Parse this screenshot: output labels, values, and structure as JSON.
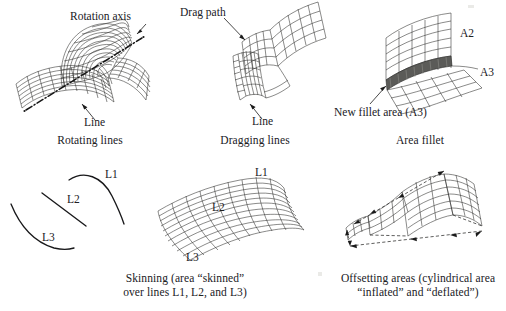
{
  "figure": {
    "background_color": "#ffffff",
    "ink_color": "#20201e",
    "panel_count": 6,
    "layout": "2 rows x 3 columns"
  },
  "panels": [
    {
      "id": "rotating-lines",
      "caption": "Rotating lines",
      "annotations": [
        {
          "name": "rotation-axis",
          "text": "Rotation axis"
        },
        {
          "name": "line",
          "text": "Line"
        }
      ]
    },
    {
      "id": "dragging-lines",
      "caption": "Dragging lines",
      "annotations": [
        {
          "name": "drag-path",
          "text": "Drag path"
        },
        {
          "name": "line",
          "text": "Line"
        }
      ]
    },
    {
      "id": "area-fillet",
      "caption": "Area fillet",
      "annotations": [
        {
          "name": "area-a2",
          "text": "A2"
        },
        {
          "name": "area-a3",
          "text": "A3"
        },
        {
          "name": "new-fillet-area",
          "text": "New fillet area (A3)"
        }
      ]
    },
    {
      "id": "skinning-lines",
      "caption": "Skinning (area “skinned”\nover lines L1, L2, and L3)",
      "annotations": [
        {
          "name": "curve-l1",
          "text": "L1"
        },
        {
          "name": "curve-l2",
          "text": "L2"
        },
        {
          "name": "curve-l3",
          "text": "L3"
        }
      ]
    },
    {
      "id": "skinning-surface",
      "caption": "",
      "annotations": [
        {
          "name": "curve-l1",
          "text": "L1"
        },
        {
          "name": "curve-l2",
          "text": "L2"
        },
        {
          "name": "curve-l3",
          "text": "L3"
        }
      ]
    },
    {
      "id": "offsetting-areas",
      "caption": "Offsetting areas (cylindrical area\n“inflated” and “deflated”)",
      "annotations": []
    }
  ],
  "text": {
    "rotation_axis": "Rotation axis",
    "line_1": "Line",
    "line_2": "Line",
    "drag_path": "Drag path",
    "a2": "A2",
    "a3": "A3",
    "new_fillet_area": "New fillet area (A3)",
    "cap_rotating": "Rotating lines",
    "cap_dragging": "Dragging lines",
    "cap_fillet": "Area fillet",
    "cap_skinning": "Skinning (area “skinned”\nover lines L1, L2, and L3)",
    "cap_offsetting": "Offsetting areas (cylindrical area\n“inflated” and “deflated”)",
    "l1_curve": "L1",
    "l2_curve": "L2",
    "l3_curve": "L3",
    "l1_surf": "L1",
    "l2_surf": "L2",
    "l3_surf": "L3"
  }
}
